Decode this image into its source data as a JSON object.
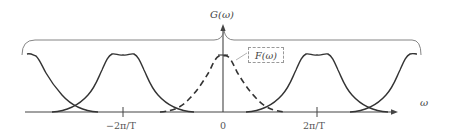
{
  "diagram": {
    "type": "spectrum-aliasing",
    "labels": {
      "g_label": "G(ω)",
      "f_label": "F(ω)",
      "x_axis_label": "ω",
      "tick_neg": "−2π/T",
      "tick_zero": "0",
      "tick_pos": "2π/T"
    },
    "elements": [
      {
        "name": "baseband-spectrum",
        "style": "dashed",
        "center": "0",
        "label": "F(ω)"
      },
      {
        "name": "replica-neg-1",
        "style": "solid",
        "center": "−2π/T"
      },
      {
        "name": "replica-pos-1",
        "style": "solid",
        "center": "2π/T"
      },
      {
        "name": "replica-neg-2",
        "style": "solid",
        "center": "−4π/T",
        "partial": true
      },
      {
        "name": "replica-pos-2",
        "style": "solid",
        "center": "4π/T",
        "partial": true
      },
      {
        "name": "brace",
        "spans": "all spectra",
        "label": "G(ω)"
      }
    ],
    "colors": {
      "curve": "#333333",
      "axis": "#444444",
      "brace": "#777777",
      "box_border": "#999999"
    }
  }
}
